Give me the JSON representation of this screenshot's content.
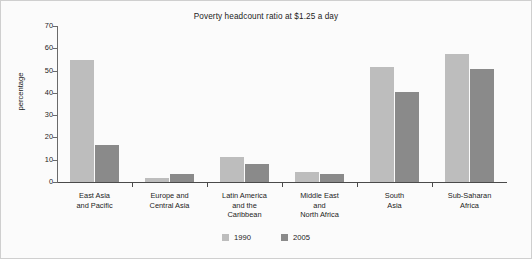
{
  "chart_data": {
    "type": "bar",
    "title": "Poverty headcount ratio at $1.25 a day",
    "xlabel": "",
    "ylabel": "percentage",
    "ylim": [
      0,
      70
    ],
    "yticks": [
      0,
      10,
      20,
      30,
      40,
      50,
      60,
      70
    ],
    "grid": false,
    "legend_position": "bottom-center",
    "categories": [
      "East Asia\nand Pacific",
      "Europe and\nCentral Asia",
      "Latin America\nand the\nCaribbean",
      "Middle East\nand\nNorth Africa",
      "South\nAsia",
      "Sub-Saharan\nAfrica"
    ],
    "series": [
      {
        "name": "1990",
        "color": "#bdbdbd",
        "values": [
          54.7,
          2.0,
          11.3,
          4.3,
          51.7,
          57.6
        ]
      },
      {
        "name": "2005",
        "color": "#8a8a8a",
        "values": [
          16.8,
          3.8,
          8.2,
          3.6,
          40.3,
          50.9
        ]
      }
    ]
  },
  "legend": {
    "items": [
      {
        "label": "1990"
      },
      {
        "label": "2005"
      }
    ]
  }
}
